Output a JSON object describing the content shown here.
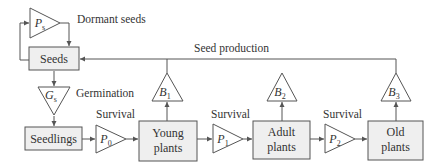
{
  "diagram": {
    "labels": {
      "dormant_seeds": "Dormant seeds",
      "seed_production": "Seed production",
      "germination": "Germination",
      "survival_0": "Survival",
      "survival_1": "Survival",
      "survival_2": "Survival"
    },
    "boxes": {
      "seeds": "Seeds",
      "seedlings": "Seedlings",
      "young_line1": "Young",
      "young_line2": "plants",
      "adult_line1": "Adult",
      "adult_line2": "plants",
      "old_line1": "Old",
      "old_line2": "plants"
    },
    "triangles": {
      "ps": {
        "symbol": "P",
        "subscript": "s"
      },
      "gs": {
        "symbol": "G",
        "subscript": "s"
      },
      "p0": {
        "symbol": "P",
        "subscript": "0"
      },
      "p1": {
        "symbol": "P",
        "subscript": "1"
      },
      "p2": {
        "symbol": "P",
        "subscript": "2"
      },
      "b1": {
        "symbol": "B",
        "subscript": "1"
      },
      "b2": {
        "symbol": "B",
        "subscript": "2"
      },
      "b3": {
        "symbol": "B",
        "subscript": "3"
      }
    },
    "colors": {
      "box_fill": "#efefef",
      "stroke": "#555555",
      "text": "#333333"
    }
  }
}
